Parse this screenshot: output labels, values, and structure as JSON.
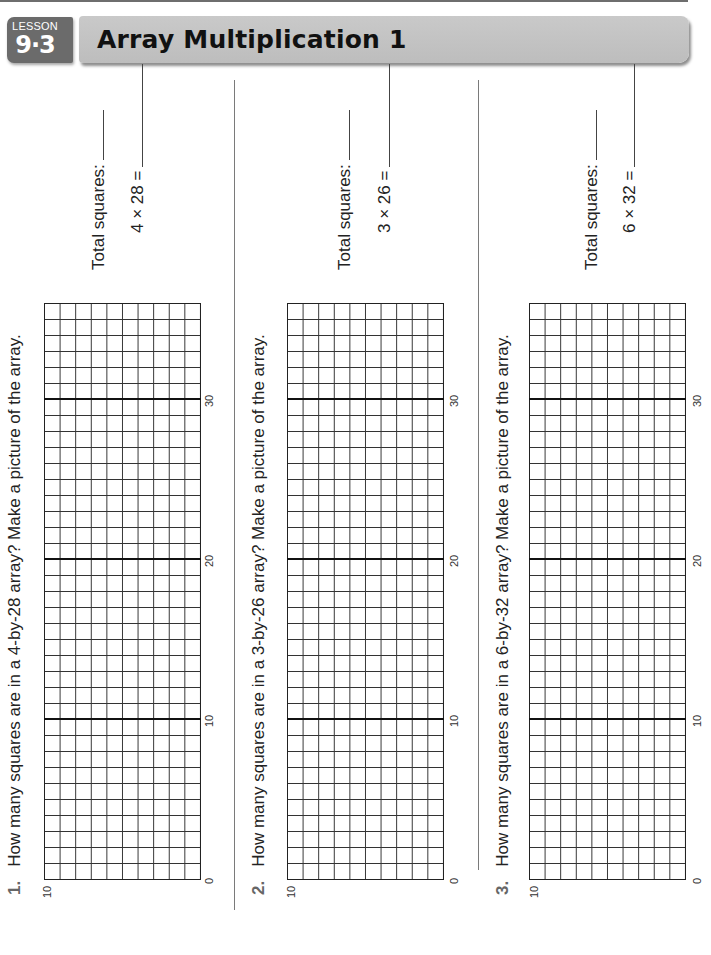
{
  "header": {
    "lesson_word": "LESSON",
    "lesson_number": "9·3",
    "title": "Array Multiplication 1"
  },
  "problems": [
    {
      "number": "1.",
      "question": "How many squares are in a 4-by-28 array? Make a picture of the array.",
      "total_label": "Total squares:",
      "equation": "4 × 28 =",
      "grid": {
        "columns": 10,
        "rows": 36
      },
      "tick_labels": {
        "side": "10",
        "origin": "0",
        "marks": [
          "10",
          "20",
          "30"
        ]
      }
    },
    {
      "number": "2.",
      "question": "How many squares are in a 3-by-26 array? Make a picture of the array.",
      "total_label": "Total squares:",
      "equation": "3 × 26 =",
      "grid": {
        "columns": 10,
        "rows": 36
      },
      "tick_labels": {
        "side": "10",
        "origin": "0",
        "marks": [
          "10",
          "20",
          "30"
        ]
      }
    },
    {
      "number": "3.",
      "question": "How many squares are in a 6-by-32 array? Make a picture of the array.",
      "total_label": "Total squares:",
      "equation": "6 × 32 =",
      "grid": {
        "columns": 10,
        "rows": 36
      },
      "tick_labels": {
        "side": "10",
        "origin": "0",
        "marks": [
          "10",
          "20",
          "30"
        ]
      }
    }
  ],
  "colors": {
    "header_badge": "#6b6b6b",
    "title_bar": "#c4c4c4",
    "problem_number": "#666666"
  }
}
